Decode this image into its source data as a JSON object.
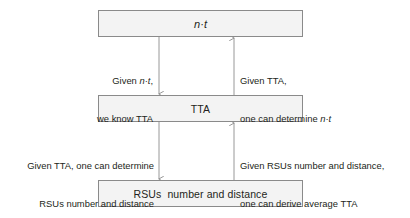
{
  "diagram": {
    "type": "flow-diagram",
    "background_color": "#ffffff",
    "node_fill_color": "#f3f3f3",
    "node_border_color": "#8a8a8a",
    "arrow_color": "#8c8c8c",
    "text_color": "#231f20",
    "nodes": [
      {
        "id": "nt",
        "label": "n·t",
        "italic": true
      },
      {
        "id": "tta",
        "label": "TTA",
        "italic": false
      },
      {
        "id": "rsus",
        "label": "RSUs  number and distance",
        "italic": false
      }
    ],
    "edges": [
      {
        "id": "nt-to-tta",
        "from": "nt",
        "to": "tta",
        "direction": "down",
        "label_line1": "Given n·t,",
        "label_line2": "we know TTA",
        "align": "right"
      },
      {
        "id": "tta-to-nt",
        "from": "tta",
        "to": "nt",
        "direction": "up",
        "label_line1": "Given TTA,",
        "label_line2": "one can determine n·t",
        "align": "left"
      },
      {
        "id": "tta-to-rsus",
        "from": "tta",
        "to": "rsus",
        "direction": "down",
        "label_line1": "Given TTA, one can determine",
        "label_line2": "RSUs number and distance",
        "align": "right"
      },
      {
        "id": "rsus-to-tta",
        "from": "rsus",
        "to": "tta",
        "direction": "up",
        "label_line1": "Given RSUs number and distance,",
        "label_line2": "one can derive average TTA",
        "align": "left"
      }
    ]
  }
}
